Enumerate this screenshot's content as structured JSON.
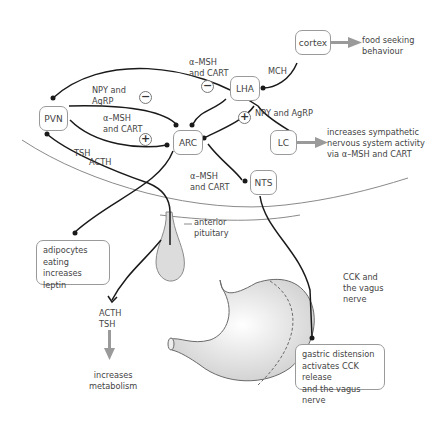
{
  "nodes": {
    "cortex": "cortex",
    "lha": "LHA",
    "pvn": "PVN",
    "arc": "ARC",
    "lc": "LC",
    "nts": "NTS"
  },
  "labels": {
    "food_seeking": "food seeking\nbehaviour",
    "mch": "MCH",
    "msh_cart_top": "α–MSH\nand CART",
    "npy_agrp_left": "NPY and\nAgRP",
    "msh_cart_left": "α–MSH\nand CART",
    "npy_agrp_right": "NPY and AgRP",
    "sympathetic": "increases sympathetic\nnervous system activity\nvia α–MSH and CART",
    "tsh": "TSH",
    "acth": "ACTH",
    "msh_cart_nts": "α–MSH\nand CART",
    "anterior_pituitary": "anterior\npituitary",
    "acth_tsh": "ACTH\nTSH",
    "increases_metabolism": "increases\nmetabolism",
    "cck_vagus": "CCK and\nthe vagus\nnerve"
  },
  "signs": {
    "top_minus": "−",
    "left_minus": "−",
    "left_plus": "+",
    "right_plus": "+"
  },
  "boxes": {
    "adipocytes": "adipocytes\neating increases\nleptin",
    "gastric": "gastric distension\nactivates CCK release\nand the vagus nerve"
  },
  "colors": {
    "line": "#1a1a1a",
    "grey_arrow": "#9a9a9a",
    "node_border": "#9a9a9a",
    "organ_fill": "#d9d9d9"
  }
}
